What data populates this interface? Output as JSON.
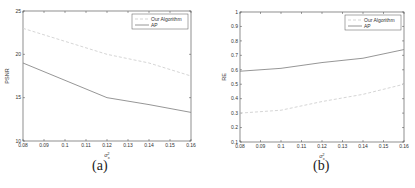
{
  "chart_data": [
    {
      "type": "line",
      "panel": "(a)",
      "caption": "(a)",
      "title": "",
      "xlabel": "σ_x^2",
      "ylabel": "PSNR",
      "xlim": [
        0.08,
        0.16
      ],
      "ylim": [
        10,
        25
      ],
      "xticks": [
        "0.08",
        "0.09",
        "0.1",
        "0.11",
        "0.12",
        "0.13",
        "0.14",
        "0.15",
        "0.16"
      ],
      "yticks": [
        "10",
        "15",
        "20",
        "25"
      ],
      "grid": false,
      "legend_position": "upper right",
      "x": [
        0.08,
        0.1,
        0.12,
        0.14,
        0.16
      ],
      "series": [
        {
          "name": "Our Algorithm",
          "style": "dashed",
          "color": "#d0d0d0",
          "values": [
            23.0,
            21.5,
            20.0,
            19.0,
            17.5
          ]
        },
        {
          "name": "AP",
          "style": "solid",
          "color": "#8a8a8a",
          "values": [
            19.0,
            17.0,
            15.0,
            14.2,
            13.3
          ]
        }
      ]
    },
    {
      "type": "line",
      "panel": "(b)",
      "caption": "(b)",
      "title": "",
      "xlabel": "σ_x^2",
      "ylabel": "RE",
      "xlim": [
        0.08,
        0.16
      ],
      "ylim": [
        0.1,
        1.0
      ],
      "xticks": [
        "0.08",
        "0.09",
        "0.1",
        "0.11",
        "0.12",
        "0.13",
        "0.14",
        "0.15",
        "0.16"
      ],
      "yticks": [
        "0.1",
        "0.2",
        "0.3",
        "0.4",
        "0.5",
        "0.6",
        "0.7",
        "0.8",
        "0.9",
        "1"
      ],
      "grid": false,
      "legend_position": "upper right",
      "x": [
        0.08,
        0.1,
        0.12,
        0.14,
        0.16
      ],
      "series": [
        {
          "name": "Our Algorithm",
          "style": "dashed",
          "color": "#d0d0d0",
          "values": [
            0.3,
            0.32,
            0.38,
            0.43,
            0.5
          ]
        },
        {
          "name": "AP",
          "style": "solid",
          "color": "#8a8a8a",
          "values": [
            0.59,
            0.61,
            0.65,
            0.68,
            0.74
          ]
        }
      ]
    }
  ],
  "panels": {
    "a": {
      "caption": "(a)",
      "ylabel": "PSNR",
      "legend": [
        "Our Algorithm",
        "AP"
      ]
    },
    "b": {
      "caption": "(b)",
      "ylabel": "RE",
      "legend": [
        "Our Algorithm",
        "AP"
      ]
    }
  }
}
